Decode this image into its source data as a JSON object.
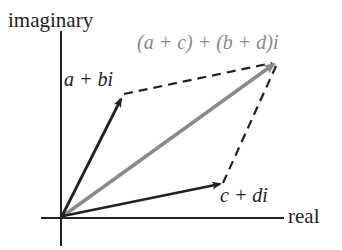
{
  "diagram": {
    "axes": {
      "vertical_label": "imaginary",
      "horizontal_label": "real"
    },
    "vectors": [
      {
        "id": "z1",
        "label": "a + bi",
        "color": "#222222",
        "from": [
          62,
          217
        ],
        "to": [
          124,
          96
        ]
      },
      {
        "id": "z2",
        "label": "c + di",
        "color": "#222222",
        "from": [
          62,
          217
        ],
        "to": [
          223,
          183
        ]
      },
      {
        "id": "sum",
        "label": "(a + c) + (b + d)i",
        "color": "#8a8a8a",
        "from": [
          62,
          217
        ],
        "to": [
          277,
          62
        ]
      }
    ],
    "dashed_edges": [
      {
        "from_label": "a + bi",
        "to_label": "(a + c) + (b + d)i"
      },
      {
        "from_label": "c + di",
        "to_label": "(a + c) + (b + d)i"
      }
    ],
    "colors": {
      "axis": "#222222",
      "vector": "#222222",
      "sum_vector": "#8a8a8a",
      "sum_label": "#8a8a8a",
      "background": "#ffffff"
    }
  }
}
